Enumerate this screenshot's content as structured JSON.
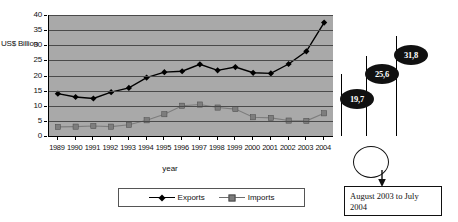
{
  "chart_data": {
    "type": "line",
    "title": "",
    "xlabel": "year",
    "ylabel": "US$ Billion",
    "ylim": [
      0,
      40
    ],
    "ytick_step": 5,
    "yticks": [
      "0",
      "5",
      "10",
      "15",
      "20",
      "25",
      "30",
      "35",
      "40"
    ],
    "grid": true,
    "legend_position": "bottom",
    "plot_background": "#a9a9a9",
    "categories": [
      "1989",
      "1990",
      "1991",
      "1992",
      "1993",
      "1994",
      "1995",
      "1996",
      "1997",
      "1998",
      "1999",
      "2000",
      "2001",
      "2002",
      "2003",
      "2004"
    ],
    "series": [
      {
        "name": "Exports",
        "color": "#000000",
        "marker": "diamond",
        "values": [
          14.0,
          12.9,
          12.4,
          14.5,
          15.9,
          19.3,
          21.1,
          21.4,
          23.7,
          21.7,
          22.8,
          20.9,
          20.7,
          23.8,
          28.0,
          37.5
        ]
      },
      {
        "name": "Imports",
        "color": "#7d7d7d",
        "marker": "square",
        "values": [
          3.0,
          3.1,
          3.3,
          3.1,
          3.7,
          5.2,
          7.2,
          10.0,
          10.4,
          9.4,
          8.9,
          6.2,
          6.0,
          5.1,
          5.0,
          7.5
        ]
      }
    ],
    "callouts": [
      {
        "label": "19,7"
      },
      {
        "label": "25,6"
      },
      {
        "label": "31,8"
      }
    ],
    "annotation_note": "August 2003 to July 2004"
  }
}
